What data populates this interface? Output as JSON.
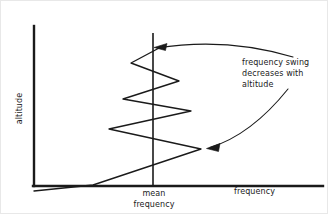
{
  "figure": {
    "background_color": "#ffffff",
    "ink_color": "#1a1a1a",
    "type": "technical-line-diagram"
  },
  "axes": {
    "y_label": "altitude",
    "x_label": "frequency",
    "origin": {
      "x": 33,
      "y": 185
    },
    "y_axis_top": {
      "x": 33,
      "y": 25
    },
    "x_axis_right": {
      "x": 322,
      "y": 185
    },
    "axis_stroke_width": 2.4
  },
  "reference_line": {
    "label_line_1": "mean",
    "label_line_2": "frequency",
    "x": 152,
    "y_top": 32,
    "y_bottom": 185,
    "stroke_width": 1.6
  },
  "waveform": {
    "description": "damped oscillation about the mean frequency, amplitude decreasing with altitude",
    "stroke_width": 1.3,
    "points": [
      {
        "x": 33,
        "y": 190
      },
      {
        "x": 92,
        "y": 184
      },
      {
        "x": 200,
        "y": 148
      },
      {
        "x": 108,
        "y": 128
      },
      {
        "x": 190,
        "y": 110
      },
      {
        "x": 122,
        "y": 98
      },
      {
        "x": 178,
        "y": 80
      },
      {
        "x": 130,
        "y": 62
      },
      {
        "x": 160,
        "y": 46
      }
    ]
  },
  "annotation": {
    "line_1": "frequency swing",
    "line_2": "decreases with",
    "line_3": "altitude",
    "leader_upper": {
      "name": "upper-leader-arrow",
      "start": {
        "x": 292,
        "y": 56
      },
      "control": {
        "x": 225,
        "y": 36
      },
      "end": {
        "x": 154,
        "y": 47
      }
    },
    "leader_lower": {
      "name": "lower-leader-arrow",
      "start": {
        "x": 287,
        "y": 88
      },
      "control": {
        "x": 250,
        "y": 135
      },
      "end": {
        "x": 206,
        "y": 147
      }
    }
  }
}
